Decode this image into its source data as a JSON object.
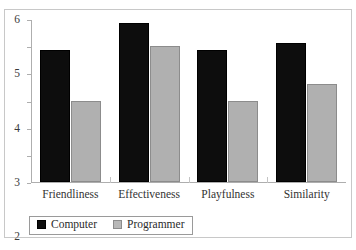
{
  "chart_data": {
    "type": "bar",
    "title": "",
    "subtitle": "",
    "xlabel": "",
    "ylabel": "",
    "categories": [
      "Friendliness",
      "Effectiveness",
      "Playfulness",
      "Similarity"
    ],
    "series": [
      {
        "name": "Computer",
        "color": "#0d0d0d",
        "values": [
          4.85,
          5.85,
          4.85,
          5.1
        ]
      },
      {
        "name": "Programmer",
        "color": "#b0b0b0",
        "values": [
          3.0,
          5.0,
          3.0,
          3.6
        ]
      }
    ],
    "ylim": [
      0,
      6
    ],
    "yticks": [
      "0",
      "1",
      "2",
      "3",
      "4",
      "5",
      "6"
    ],
    "ytick_values": [
      0,
      1,
      2,
      3,
      4,
      5,
      6
    ],
    "grid": false,
    "legend_position": "bottom-left",
    "legend_entries": [
      "Computer",
      "Programmer"
    ]
  },
  "axis": {
    "y_tick_labels": [
      "6",
      "5",
      "4",
      "3",
      "2",
      "1",
      "0"
    ]
  },
  "legend": {
    "items": [
      {
        "label": "Computer"
      },
      {
        "label": "Programmer"
      }
    ]
  }
}
